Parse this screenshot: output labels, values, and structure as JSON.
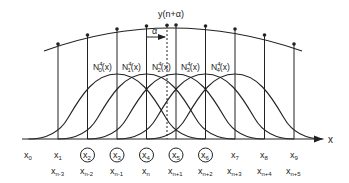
{
  "diagram": {
    "title_label": "y(n+α)",
    "alpha_label": "α",
    "axis_label": "x",
    "colors": {
      "stroke": "#222222",
      "background": "#ffffff"
    },
    "knots_top": [
      "x0",
      "x1",
      "x2",
      "x3",
      "x4",
      "x5",
      "x6",
      "x7",
      "x8",
      "x9"
    ],
    "knots_top_display": [
      {
        "base": "x",
        "sub": "0",
        "circled": false
      },
      {
        "base": "x",
        "sub": "1",
        "circled": false
      },
      {
        "base": "x",
        "sub": "2",
        "circled": true
      },
      {
        "base": "x",
        "sub": "3",
        "circled": true
      },
      {
        "base": "x",
        "sub": "4",
        "circled": true
      },
      {
        "base": "x",
        "sub": "5",
        "circled": true
      },
      {
        "base": "x",
        "sub": "6",
        "circled": true
      },
      {
        "base": "x",
        "sub": "7",
        "circled": false
      },
      {
        "base": "x",
        "sub": "8",
        "circled": false
      },
      {
        "base": "x",
        "sub": "9",
        "circled": false
      }
    ],
    "knots_bottom": [
      {
        "base": "x",
        "sub": "n-3"
      },
      {
        "base": "x",
        "sub": "n-2"
      },
      {
        "base": "x",
        "sub": "n-1"
      },
      {
        "base": "x",
        "sub": "n"
      },
      {
        "base": "x",
        "sub": "n+1"
      },
      {
        "base": "x",
        "sub": "n+2"
      },
      {
        "base": "x",
        "sub": "n+3"
      },
      {
        "base": "x",
        "sub": "n+4"
      },
      {
        "base": "x",
        "sub": "n+5"
      }
    ],
    "basis_functions": [
      {
        "name": "N",
        "sub": "0",
        "sup": "4",
        "arg": "(x)"
      },
      {
        "name": "N",
        "sub": "1",
        "sup": "4",
        "arg": "(x)"
      },
      {
        "name": "N",
        "sub": "2",
        "sup": "4",
        "arg": "(x)"
      },
      {
        "name": "N",
        "sub": "3",
        "sup": "4",
        "arg": "(x)"
      },
      {
        "name": "N",
        "sub": "4",
        "sup": "4",
        "arg": "(x)"
      }
    ]
  }
}
